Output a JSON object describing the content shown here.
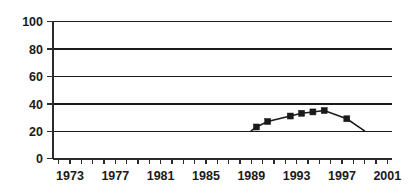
{
  "chart_data": {
    "type": "line",
    "title": "",
    "subtitle": "",
    "xlabel": "",
    "ylabel": "",
    "xlim": [
      1972,
      2002
    ],
    "ylim": [
      0,
      100
    ],
    "grid": true,
    "legend": null,
    "legend_position": "none",
    "marker": "square",
    "series_color": "#1a1a1a",
    "y_ticks": [
      0,
      20,
      40,
      60,
      80,
      100
    ],
    "y_tick_labels": [
      "0",
      "20",
      "40",
      "60",
      "80",
      "100"
    ],
    "x_ticks": [
      1973,
      1977,
      1981,
      1985,
      1989,
      1993,
      1997,
      2001
    ],
    "x_tick_labels": [
      "1973",
      "1977",
      "1981",
      "1985",
      "1989",
      "1993",
      "1997",
      "2001"
    ],
    "x_minor_tick_interval": 1,
    "x": [
      1990,
      1991,
      1993,
      1994,
      1995,
      1996,
      1998
    ],
    "values": [
      23,
      27,
      31,
      33,
      34,
      35,
      29
    ],
    "line_start": {
      "x": 1989.5,
      "y": 20
    },
    "line_end": {
      "x": 1999.6,
      "y": 20
    },
    "series": [
      {
        "name": "series-1",
        "x": [
          1990,
          1991,
          1993,
          1994,
          1995,
          1996,
          1998
        ],
        "values": [
          23,
          27,
          31,
          33,
          34,
          35,
          29
        ]
      }
    ]
  },
  "axes": {
    "y_axis_name": "y-axis",
    "x_axis_name": "x-axis"
  }
}
